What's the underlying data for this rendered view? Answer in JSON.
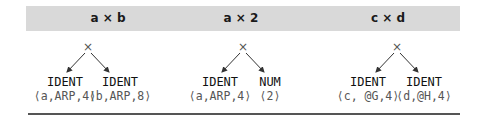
{
  "columns": [
    {
      "header": "a × b",
      "operator": "×",
      "left": {
        "type": "IDENT",
        "attr": "⟨a,ARP,4⟩"
      },
      "right": {
        "type": "IDENT",
        "attr": "⟨b,ARP,8⟩"
      }
    },
    {
      "header": "a × 2",
      "operator": "×",
      "left": {
        "type": "IDENT",
        "attr": "⟨a,ARP,4⟩"
      },
      "right": {
        "type": "NUM",
        "attr": "⟨2⟩"
      }
    },
    {
      "header": "c × d",
      "operator": "×",
      "left": {
        "type": "IDENT",
        "attr": "⟨c, @G,4⟩"
      },
      "right": {
        "type": "IDENT",
        "attr": "⟨d,@H,4⟩"
      }
    }
  ],
  "colors": {
    "header_bg": "#d9d9d9",
    "rule": "#555555",
    "edge": "#333333"
  }
}
